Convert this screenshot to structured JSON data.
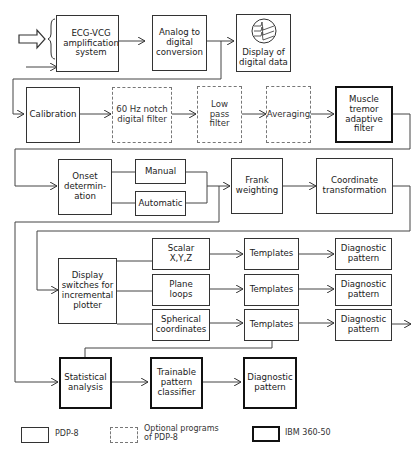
{
  "diagram": {
    "row1": {
      "input_leads_top": "A",
      "input_leads_bottom": "F",
      "ground_lead": "G",
      "amplification": "ECG-VCG\namplification\nsystem",
      "adc": "Analog to\ndigital\nconversion",
      "display": "Display of\ndigital data"
    },
    "row2": {
      "calibration": "Calibration",
      "notch": "60 Hz notch\ndigital filter",
      "lowpass": "Low\npass\nfilter",
      "averaging": "Averaging",
      "muscle": "Muscle\ntremor\nadaptive\nfilter"
    },
    "row3": {
      "onset": "Onset\ndetermin-\nation",
      "manual": "Manual",
      "automatic": "Automatic",
      "frank": "Frank\nweighting",
      "coordinate": "Coordinate\ntransformation"
    },
    "row4": {
      "display_switches": "Display\nswitches for\nincremental\nplotter",
      "branches": [
        {
          "display": "Scalar\nX,Y,Z",
          "templates": "Templates",
          "diagnostic": "Diagnostic\npattern"
        },
        {
          "display": "Plane\nloops",
          "templates": "Templates",
          "diagnostic": "Diagnostic\npattern"
        },
        {
          "display": "Spherical\ncoordinates",
          "templates": "Templates",
          "diagnostic": "Diagnostic\npattern"
        }
      ]
    },
    "row5": {
      "statistical": "Statistical\nanalysis",
      "trainable": "Trainable\npattern\nclassifier",
      "diagnostic": "Diagnostic\npattern"
    }
  },
  "legend": {
    "pdp8": "PDP-8",
    "optional": "Optional programs\nof PDP-8",
    "ibm": "IBM 360-50"
  },
  "colors": {
    "line": "#444444",
    "dashed": "#777777",
    "heavy": "#111111"
  }
}
